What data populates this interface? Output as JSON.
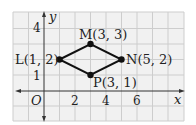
{
  "diagram": {
    "type": "coordinate-plane",
    "axes": {
      "x_label": "x",
      "y_label": "y",
      "origin_label": "O",
      "x_ticks": [
        {
          "value": 2,
          "label": "2"
        },
        {
          "value": 4,
          "label": "4"
        },
        {
          "value": 6,
          "label": "6"
        }
      ],
      "y_ticks": [
        {
          "value": 1,
          "label": "1"
        },
        {
          "value": 4,
          "label": "4"
        }
      ]
    },
    "points": [
      {
        "name": "L",
        "x": 1,
        "y": 2,
        "label": "L(1, 2)"
      },
      {
        "name": "M",
        "x": 3,
        "y": 3,
        "label": "M(3, 3)"
      },
      {
        "name": "N",
        "x": 5,
        "y": 2,
        "label": "N(5, 2)"
      },
      {
        "name": "P",
        "x": 3,
        "y": 1,
        "label": "P(3, 1)"
      }
    ],
    "polygon": [
      "L",
      "M",
      "N",
      "P"
    ],
    "colors": {
      "grid_bg": "#f1f1f1",
      "grid_line": "#cdcdcd",
      "axis": "#333333",
      "shape": "#111111"
    }
  }
}
